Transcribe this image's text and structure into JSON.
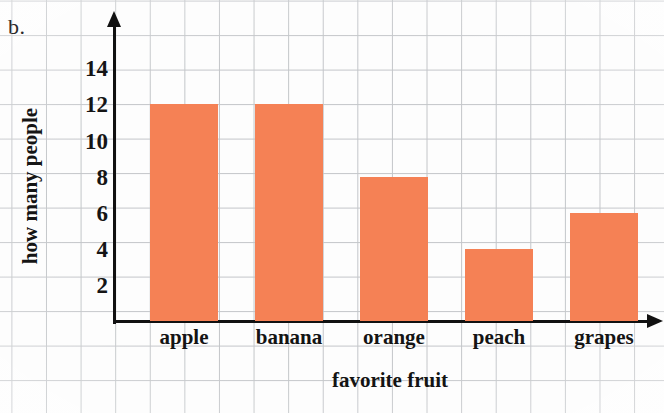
{
  "problem": {
    "letter": "b."
  },
  "chart_data": {
    "type": "bar",
    "title": "",
    "xlabel": "favorite fruit",
    "ylabel": "how many people",
    "categories": [
      "apple",
      "banana",
      "orange",
      "peach",
      "grapes"
    ],
    "values": [
      12,
      12,
      8,
      4,
      6
    ],
    "ylim": [
      0,
      15
    ],
    "y_ticks": [
      2,
      4,
      6,
      8,
      10,
      12,
      14
    ],
    "y_tick_labels": [
      "2",
      "4",
      "6",
      "8",
      "10",
      "12",
      "14"
    ],
    "grid": true,
    "legend": "none",
    "bar_color": "#f58155",
    "axis_color": "#111111",
    "grid_color": "#b9bcc0",
    "background_color": "#fdfdfd"
  }
}
